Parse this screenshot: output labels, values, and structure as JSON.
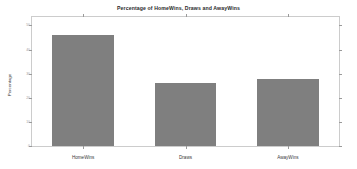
{
  "figure": {
    "title": "Percentage of HomeWins, Draws and AwayWins",
    "ylabel": "Percentage",
    "xlabel": "",
    "bar_color": "#7f7f7f",
    "frame_color": "#cccccc"
  },
  "chart_data": {
    "type": "bar",
    "title": "Percentage of HomeWins, Draws and AwayWins",
    "xlabel": "",
    "ylabel": "Percentage",
    "categories": [
      "HomeWins",
      "Draws",
      "AwayWins"
    ],
    "values": [
      46,
      26,
      28
    ],
    "ylim": [
      0,
      53.5
    ],
    "yticks": [
      0,
      10,
      20,
      30,
      40,
      50
    ],
    "ytick_labels": [
      "0",
      "10",
      "20",
      "30",
      "40",
      "50"
    ],
    "grid": false,
    "legend": null,
    "series": [
      {
        "name": "Percentage",
        "values": [
          46,
          26,
          28
        ]
      }
    ]
  }
}
